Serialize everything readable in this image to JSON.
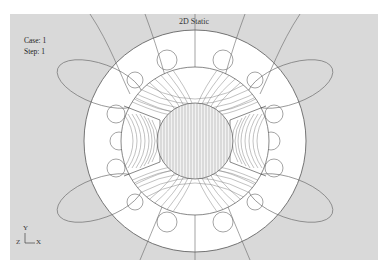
{
  "viewport": {
    "title": "2D Static",
    "case_label": "Case: 1",
    "step_label": "Step: 1",
    "background": "#d9d9d9",
    "stator_fill": "#ffffff",
    "line_color": "#555555"
  },
  "triad": {
    "y_axis": "Y",
    "x_axis": "X",
    "z_axis": "Z"
  },
  "geometry": {
    "center": [
      185,
      127
    ],
    "outer_circle_radius": 111,
    "rotor_radius": 74,
    "shaft_radius": 38,
    "poles": 4
  }
}
